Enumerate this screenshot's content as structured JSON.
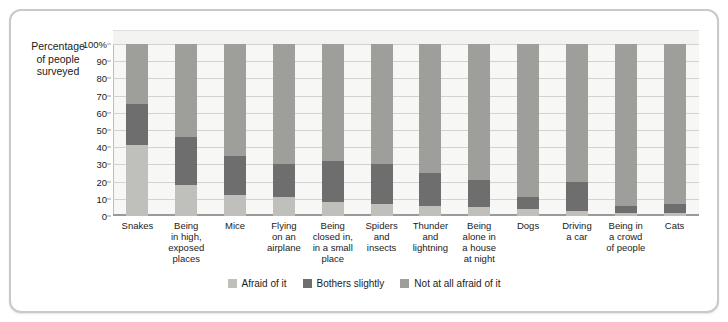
{
  "axis_title": "Percentage\nof people\nsurveyed",
  "chart_data": {
    "type": "bar",
    "subtype": "stacked-bar-100",
    "title": "",
    "xlabel": "",
    "ylabel": "Percentage of people surveyed",
    "ylim": [
      0,
      100
    ],
    "yticks": [
      "0",
      "10",
      "20",
      "30",
      "40",
      "50",
      "60",
      "70",
      "80",
      "90",
      "100%"
    ],
    "ytick_values": [
      0,
      10,
      20,
      30,
      40,
      50,
      60,
      70,
      80,
      90,
      100
    ],
    "grid": true,
    "legend_position": "bottom",
    "categories": [
      "Snakes",
      "Being\nin high,\nexposed\nplaces",
      "Mice",
      "Flying\non an\nairplane",
      "Being\nclosed in,\nin a small\nplace",
      "Spiders\nand\ninsects",
      "Thunder\nand\nlightning",
      "Being\nalone in\na house\nat night",
      "Dogs",
      "Driving\na car",
      "Being in\na crowd\nof people",
      "Cats"
    ],
    "series": [
      {
        "name": "Afraid of it",
        "color": "#bfbfbb",
        "values": [
          41,
          18,
          12,
          11,
          8,
          7,
          6,
          5,
          4,
          3,
          2,
          2
        ]
      },
      {
        "name": "Bothers slightly",
        "color": "#6e6e6e",
        "values": [
          24,
          28,
          23,
          19,
          24,
          23,
          19,
          16,
          7,
          17,
          4,
          5
        ]
      },
      {
        "name": "Not at all afraid of it",
        "color": "#9e9e9a",
        "values": [
          35,
          54,
          65,
          70,
          68,
          70,
          75,
          79,
          89,
          80,
          94,
          93
        ]
      }
    ]
  },
  "legend": [
    {
      "label": "Afraid of it",
      "color": "#bfbfbb"
    },
    {
      "label": "Bothers slightly",
      "color": "#6e6e6e"
    },
    {
      "label": "Not at all afraid of it",
      "color": "#9e9e9a"
    }
  ]
}
